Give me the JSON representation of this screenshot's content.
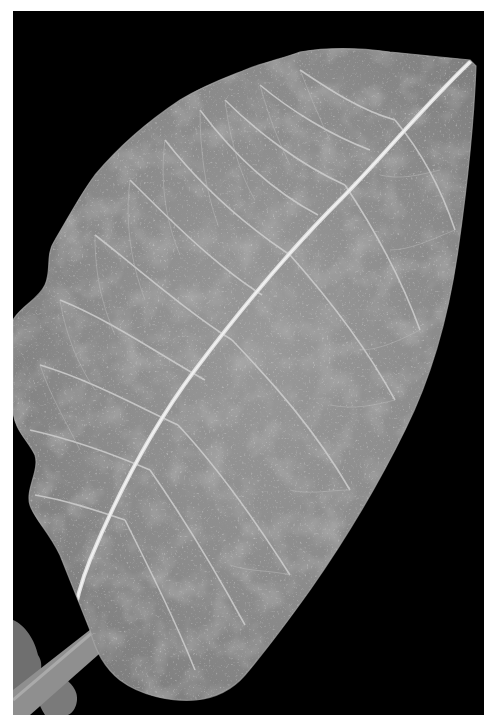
{
  "image": {
    "subject": "leaf",
    "description": "Grayscale photograph of a large broad leaf with prominent white midrib and lateral veins on a black background",
    "colors": {
      "border": "#ffffff",
      "background": "#000000",
      "leaf_fill": "#8c8c8c",
      "leaf_dark": "#6e6e6e",
      "vein": "#d2d2d2",
      "stem": "#9a9a9a"
    },
    "photo_bounds": {
      "x": 13,
      "y": 11,
      "width": 471,
      "height": 704
    }
  }
}
